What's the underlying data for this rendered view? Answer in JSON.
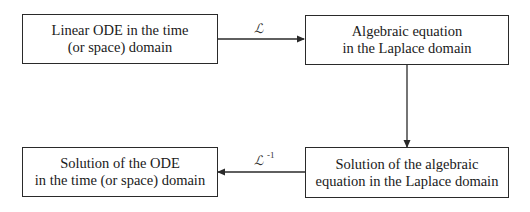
{
  "boxes": {
    "linear_ode": {
      "line1": "Linear ODE in the time",
      "line2": "(or space) domain"
    },
    "algebraic_eq": {
      "line1": "Algebraic equation",
      "line2": "in the Laplace domain"
    },
    "algebraic_solution": {
      "line1": "Solution of the algebraic",
      "line2": "equation in the Laplace domain"
    },
    "ode_solution": {
      "line1": "Solution of the ODE",
      "line2": "in the time (or space) domain"
    }
  },
  "arrows": {
    "forward_transform": {
      "symbol": "ℒ",
      "superscript": ""
    },
    "inverse_transform": {
      "symbol": "ℒ",
      "superscript": "-1"
    }
  },
  "colors": {
    "line": "#2a2a2a",
    "background": "#ffffff",
    "text": "#1a1a1a"
  }
}
